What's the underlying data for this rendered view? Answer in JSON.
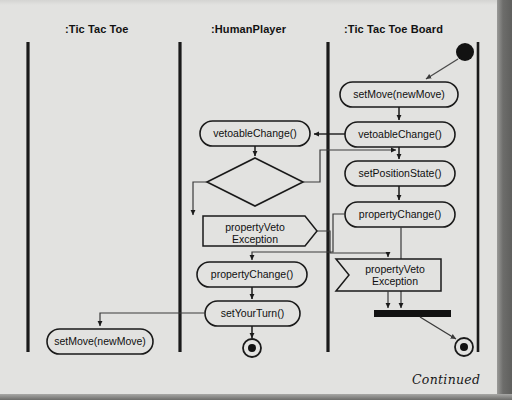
{
  "diagram": {
    "title_note": "Continued",
    "background_color": "#e2e2e0",
    "line_color": "#1a1a1a",
    "node_fill": "#e2e2e0"
  },
  "swimlanes": [
    {
      "id": "tictactoe",
      "label": ":Tic Tac Toe",
      "header_x": 65,
      "divider_x": 28
    },
    {
      "id": "humanplayer",
      "label": ":HumanPlayer",
      "header_x": 211,
      "divider_x": 180
    },
    {
      "id": "board",
      "label": ":Tic Tac Toe Board",
      "header_x": 344,
      "divider_x": 328
    },
    {
      "id": "edge",
      "label": "",
      "header_x": 0,
      "divider_x": 478
    }
  ],
  "nodes": [
    {
      "id": "initial",
      "type": "initial-node",
      "lane": "board",
      "label": "",
      "cx": 465,
      "cy": 52
    },
    {
      "id": "set-move-board",
      "type": "action",
      "lane": "board",
      "label": "setMove(newMove)",
      "x": 340,
      "y": 82,
      "w": 118,
      "h": 25
    },
    {
      "id": "vetoable-board",
      "type": "action",
      "lane": "board",
      "label": "vetoableChange()",
      "x": 345,
      "y": 122,
      "w": 110,
      "h": 25
    },
    {
      "id": "set-position",
      "type": "action",
      "lane": "board",
      "label": "setPositionState()",
      "x": 345,
      "y": 161,
      "w": 110,
      "h": 25
    },
    {
      "id": "property-board",
      "type": "action",
      "lane": "board",
      "label": "propertyChange()",
      "x": 345,
      "y": 202,
      "w": 110,
      "h": 25
    },
    {
      "id": "veto-recv-board",
      "type": "receive-signal",
      "lane": "board",
      "label": "propertyVeto\nException",
      "x": 336,
      "y": 259,
      "w": 105,
      "h": 32
    },
    {
      "id": "join-bar",
      "type": "join-bar",
      "lane": "board",
      "label": "",
      "x": 374,
      "y": 310,
      "w": 77,
      "h": 7
    },
    {
      "id": "final-board",
      "type": "final-node",
      "lane": "board",
      "label": "",
      "cx": 464,
      "cy": 347
    },
    {
      "id": "vetoable-human",
      "type": "action",
      "lane": "humanplayer",
      "label": "vetoableChange()",
      "x": 200,
      "y": 121,
      "w": 110,
      "h": 25
    },
    {
      "id": "decision",
      "type": "decision",
      "lane": "humanplayer",
      "label": "",
      "x": 207,
      "y": 158,
      "w": 96,
      "h": 48
    },
    {
      "id": "veto-send-human",
      "type": "send-signal",
      "lane": "humanplayer",
      "label": "propertyVeto\nException",
      "x": 203,
      "y": 216,
      "w": 114,
      "h": 30
    },
    {
      "id": "property-human",
      "type": "action",
      "lane": "humanplayer",
      "label": "propertyChange()",
      "x": 197,
      "y": 262,
      "w": 110,
      "h": 25
    },
    {
      "id": "set-your-turn",
      "type": "action",
      "lane": "humanplayer",
      "label": "setYourTurn()",
      "x": 205,
      "y": 301,
      "w": 95,
      "h": 25
    },
    {
      "id": "final-human",
      "type": "final-node",
      "lane": "humanplayer",
      "label": "",
      "cx": 252,
      "cy": 348
    },
    {
      "id": "set-move-game",
      "type": "action",
      "lane": "tictactoe",
      "label": "setMove(newMove)",
      "x": 47,
      "y": 329,
      "w": 106,
      "h": 25
    }
  ],
  "edges": [
    {
      "id": "e-initial-setmove",
      "from": "initial",
      "to": "set-move-board",
      "kind": "diagonal"
    },
    {
      "id": "e-setmove-vetoable",
      "from": "set-move-board",
      "to": "vetoable-board",
      "kind": "straight"
    },
    {
      "id": "e-vetoable-setposition",
      "from": "vetoable-board",
      "to": "set-position",
      "kind": "straight"
    },
    {
      "id": "e-setposition-property",
      "from": "set-position",
      "to": "property-board",
      "kind": "straight"
    },
    {
      "id": "e-vetoable-to-human",
      "from": "vetoable-board",
      "to": "vetoable-human",
      "kind": "horizontal-left"
    },
    {
      "id": "e-human-vetoable-decision",
      "from": "vetoable-human",
      "to": "decision",
      "kind": "straight"
    },
    {
      "id": "e-decision-veto-send",
      "from": "decision",
      "to": "veto-send-human",
      "kind": "elbow-left"
    },
    {
      "id": "e-decision-to-board",
      "from": "decision",
      "to": "set-position",
      "kind": "elbow-right"
    },
    {
      "id": "e-veto-send-to-board",
      "from": "veto-send-human",
      "to": "veto-recv-board",
      "kind": "elbow-right"
    },
    {
      "id": "e-property-to-human",
      "from": "property-board",
      "to": "property-human",
      "kind": "elbow-left"
    },
    {
      "id": "e-property-setyourturn",
      "from": "property-human",
      "to": "set-your-turn",
      "kind": "straight"
    },
    {
      "id": "e-setyourturn-final",
      "from": "set-your-turn",
      "to": "final-human",
      "kind": "straight"
    },
    {
      "id": "e-setyourturn-setmove",
      "from": "set-your-turn",
      "to": "set-move-game",
      "kind": "elbow-left"
    },
    {
      "id": "e-vetorecv-join",
      "from": "veto-recv-board",
      "to": "join-bar",
      "kind": "straight"
    },
    {
      "id": "e-property-join",
      "from": "property-board",
      "to": "join-bar",
      "kind": "straight"
    },
    {
      "id": "e-join-final",
      "from": "join-bar",
      "to": "final-board",
      "kind": "diagonal"
    }
  ]
}
